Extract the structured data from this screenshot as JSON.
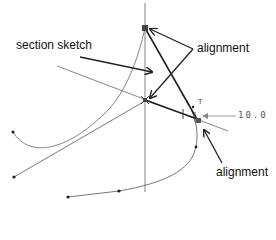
{
  "labels": {
    "section_sketch": "section sketch",
    "alignment_top": "alignment",
    "alignment_bottom": "alignment",
    "dimension_value": "10.0",
    "tangent_mark": "T"
  },
  "colors": {
    "background": "#ffffff",
    "line": "#333333",
    "bold_line": "#222222",
    "thin_line": "#666666",
    "text": "#111111",
    "dimension": "#555555"
  }
}
